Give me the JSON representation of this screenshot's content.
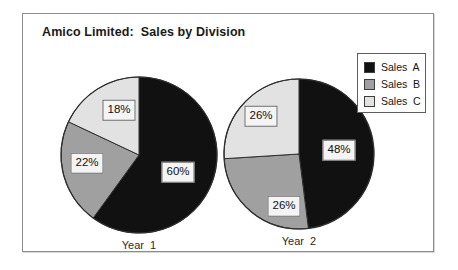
{
  "frame": {
    "border_color": "#8c8c8c",
    "background": "#ffffff"
  },
  "title": "Amico Limited:  Sales by Division",
  "legend": {
    "items": [
      {
        "label": "Sales  A",
        "color": "#111111"
      },
      {
        "label": "Sales  B",
        "color": "#a0a0a0"
      },
      {
        "label": "Sales  C",
        "color": "#e2e2e2"
      }
    ]
  },
  "chart_data": {
    "type": "pie",
    "title": "Amico Limited:  Sales by Division",
    "legend_position": "right",
    "series_names": [
      "Sales  A",
      "Sales  B",
      "Sales  C"
    ],
    "colors": [
      "#111111",
      "#a0a0a0",
      "#e2e2e2"
    ],
    "charts": [
      {
        "caption": "Year  1",
        "categories": [
          "Sales  A",
          "Sales  B",
          "Sales  C"
        ],
        "values": [
          60,
          22,
          18
        ],
        "labels": [
          "60%",
          "22%",
          "18%"
        ],
        "center": [
          100,
          100
        ],
        "radius": 78,
        "label_positions": [
          [
            139,
            117
          ],
          [
            48,
            108
          ],
          [
            80,
            55
          ]
        ]
      },
      {
        "caption": "Year  2",
        "categories": [
          "Sales  A",
          "Sales  B",
          "Sales  C"
        ],
        "values": [
          48,
          26,
          26
        ],
        "labels": [
          "48%",
          "26%",
          "26%"
        ],
        "center": [
          100,
          96
        ],
        "radius": 75,
        "label_positions": [
          [
            140,
            92
          ],
          [
            85,
            148
          ],
          [
            62,
            58
          ]
        ]
      }
    ]
  }
}
